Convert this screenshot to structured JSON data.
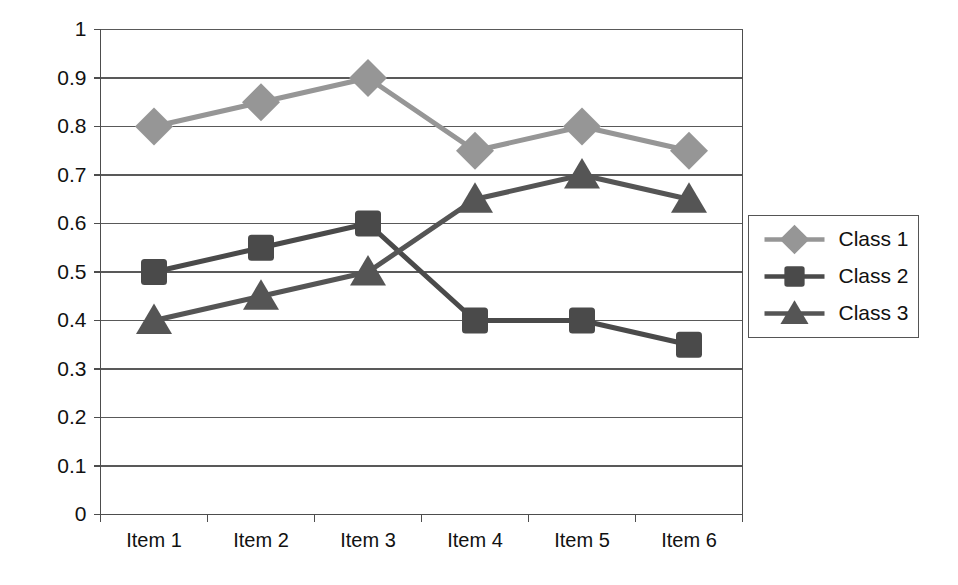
{
  "chart_data": {
    "type": "line",
    "title": "",
    "subtitle": "",
    "xlabel": "",
    "ylabel": "",
    "categories": [
      "Item 1",
      "Item 2",
      "Item 3",
      "Item 4",
      "Item 5",
      "Item 6"
    ],
    "ylim": [
      0,
      1
    ],
    "ytick_labels": [
      "0",
      "0.1",
      "0.2",
      "0.3",
      "0.4",
      "0.5",
      "0.6",
      "0.7",
      "0.8",
      "0.9",
      "1"
    ],
    "ytick_values": [
      0,
      0.1,
      0.2,
      0.3,
      0.4,
      0.5,
      0.6,
      0.7,
      0.8,
      0.9,
      1
    ],
    "grid": "horizontal",
    "legend_position": "right",
    "series": [
      {
        "name": "Class 1",
        "marker": "diamond",
        "color": "#969696",
        "values": [
          0.8,
          0.85,
          0.9,
          0.75,
          0.8,
          0.75
        ]
      },
      {
        "name": "Class 2",
        "marker": "square",
        "color": "#4a4a4a",
        "values": [
          0.5,
          0.55,
          0.6,
          0.4,
          0.4,
          0.35
        ]
      },
      {
        "name": "Class 3",
        "marker": "triangle",
        "color": "#555555",
        "values": [
          0.4,
          0.45,
          0.5,
          0.65,
          0.7,
          0.65
        ]
      }
    ]
  },
  "legend": {
    "entries": [
      {
        "label": "Class 1"
      },
      {
        "label": "Class 2"
      },
      {
        "label": "Class 3"
      }
    ]
  },
  "axes": {
    "y_labels": [
      "1",
      "0.9",
      "0.8",
      "0.7",
      "0.6",
      "0.5",
      "0.4",
      "0.3",
      "0.2",
      "0.1",
      "0"
    ],
    "x_labels": [
      "Item 1",
      "Item 2",
      "Item 3",
      "Item 4",
      "Item 5",
      "Item 6"
    ]
  },
  "colors": {
    "series1": "#969696",
    "series2": "#4a4a4a",
    "series3": "#555555",
    "grid": "#595959",
    "axis": "#4d4d4d",
    "text": "#111111",
    "background": "#ffffff"
  }
}
